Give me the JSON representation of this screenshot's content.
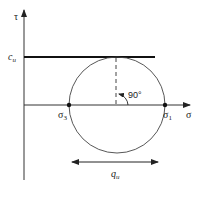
{
  "diagram": {
    "type": "mohr-circle-unconfined-compression",
    "axes": {
      "vertical": {
        "label": "τ"
      },
      "horizontal": {
        "label": "σ"
      }
    },
    "cohesion_line": {
      "label_main": "c",
      "label_sub": "u"
    },
    "points": [
      {
        "name": "sigma3",
        "label_main": "σ",
        "label_sub": "3"
      },
      {
        "name": "sigma1",
        "label_main": "σ",
        "label_sub": "1"
      }
    ],
    "angle_label": "90°",
    "dimension": {
      "label_main": "q",
      "label_sub": "u"
    }
  }
}
